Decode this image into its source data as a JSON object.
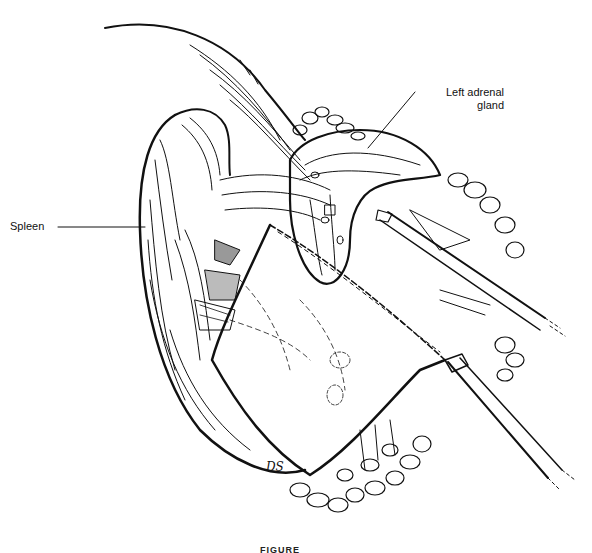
{
  "figure": {
    "type": "surgical line illustration",
    "labels": {
      "adrenal": "Left adrenal\ngland",
      "adrenal_line1": "Left adrenal",
      "adrenal_line2": "gland",
      "spleen": "Spleen"
    },
    "signature": "DS",
    "caption": "FIGURE"
  },
  "colors": {
    "ink": "#111111",
    "background": "#ffffff"
  }
}
